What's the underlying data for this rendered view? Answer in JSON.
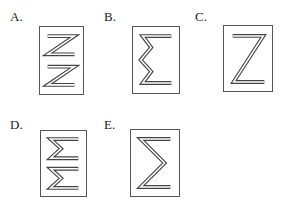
{
  "options": [
    {
      "label": "A.",
      "figure": "two stacked Z shapes (double-line)"
    },
    {
      "label": "B.",
      "figure": "sigma with zigzag spine (double-line)"
    },
    {
      "label": "C.",
      "figure": "single Z shape (double-line)"
    },
    {
      "label": "D.",
      "figure": "two stacked sigma shapes (double-line)"
    },
    {
      "label": "E.",
      "figure": "single sigma shape (double-line)"
    }
  ]
}
